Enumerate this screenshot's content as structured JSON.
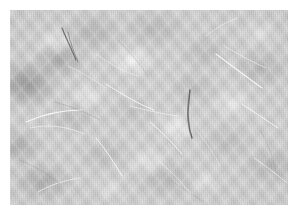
{
  "image": {
    "subject": "fibrous-nonwoven-material-micrograph",
    "alt_text": "Grayscale close-up micrograph of a fibrous nonwoven mat showing mottled light and dark clumps crossed by fine bright filaments",
    "orientation": "landscape",
    "canvas": {
      "width": 298,
      "height": 215
    },
    "plate": {
      "x": 10,
      "y": 10,
      "width": 278,
      "height": 195
    },
    "margin_px": 10
  },
  "palette": {
    "page_background": "#ffffff",
    "plate_base": "#cccccc",
    "lightest_tone": "#e4e4e4",
    "midtone": "#c4c4c4",
    "darkest_tone": "#8f8f8f",
    "bright_fiber": "#f6f6f6",
    "dark_fiber": "#4a4a4a",
    "grey_fiber": "#8d8d8d"
  },
  "texture": {
    "base_tone": "#cccccc",
    "weave_angle_primary_deg": 52,
    "weave_angle_secondary_deg": -46,
    "scanline_axis": "vertical",
    "grain": "fine"
  },
  "blotches": [
    {
      "cx": "6%",
      "cy": "38%",
      "rx": 46,
      "ry": 34,
      "tone": "#828282",
      "alpha": 0.85
    },
    {
      "cx": "18%",
      "cy": "26%",
      "rx": 38,
      "ry": 26,
      "tone": "#8c8c8c",
      "alpha": 0.7
    },
    {
      "cx": "3%",
      "cy": "70%",
      "rx": 34,
      "ry": 24,
      "tone": "#919191",
      "alpha": 0.62
    },
    {
      "cx": "30%",
      "cy": "12%",
      "rx": 40,
      "ry": 28,
      "tone": "#969696",
      "alpha": 0.55
    },
    {
      "cx": "52%",
      "cy": "10%",
      "rx": 44,
      "ry": 26,
      "tone": "#989898",
      "alpha": 0.48
    },
    {
      "cx": "70%",
      "cy": "22%",
      "rx": 36,
      "ry": 26,
      "tone": "#969696",
      "alpha": 0.42
    },
    {
      "cx": "90%",
      "cy": "30%",
      "rx": 42,
      "ry": 28,
      "tone": "#949494",
      "alpha": 0.5
    },
    {
      "cx": "12%",
      "cy": "88%",
      "rx": 40,
      "ry": 26,
      "tone": "#8e8e8e",
      "alpha": 0.6
    },
    {
      "cx": "56%",
      "cy": "86%",
      "rx": 44,
      "ry": 28,
      "tone": "#949494",
      "alpha": 0.46
    },
    {
      "cx": "94%",
      "cy": "80%",
      "rx": 42,
      "ry": 26,
      "tone": "#929292",
      "alpha": 0.46
    }
  ],
  "highlights": [
    {
      "cx": "44%",
      "cy": "26%",
      "rx": 30,
      "ry": 22,
      "alpha": 0.8
    },
    {
      "cx": "60%",
      "cy": "60%",
      "rx": 26,
      "ry": 20,
      "alpha": 0.72
    },
    {
      "cx": "28%",
      "cy": "44%",
      "rx": 24,
      "ry": 18,
      "alpha": 0.58
    },
    {
      "cx": "80%",
      "cy": "48%",
      "rx": 28,
      "ry": 20,
      "alpha": 0.56
    },
    {
      "cx": "50%",
      "cy": "78%",
      "rx": 30,
      "ry": 20,
      "alpha": 0.52
    }
  ],
  "fibers": {
    "dark": [
      {
        "id": "dark-fiber-center",
        "d": "M 180 80 C 178 96, 176 110, 182 128",
        "width": 1.6,
        "note": "prominent dark curved filament near centre"
      },
      {
        "id": "dark-fiber-upper-left",
        "d": "M 52 18 C 56 28, 62 40, 66 50",
        "width": 1.3
      },
      {
        "id": "dark-fiber-upper-left-b",
        "d": "M 58 22 C 60 32, 64 42, 68 52",
        "width": 0.9
      }
    ],
    "bright": [
      {
        "id": "bright-fiber-1",
        "d": "M 16 112 C 34 104, 52 100, 72 100",
        "width": 1.1
      },
      {
        "id": "bright-fiber-2",
        "d": "M 20 118 C 38 114, 56 116, 74 124",
        "width": 0.9
      },
      {
        "id": "bright-fiber-3",
        "d": "M 86 128 C 96 140, 104 152, 112 166",
        "width": 1.0
      },
      {
        "id": "bright-fiber-4",
        "d": "M 96 74 C 112 84, 128 94, 144 100",
        "width": 1.0
      },
      {
        "id": "bright-fiber-5",
        "d": "M 120 96 C 136 100, 152 104, 168 106",
        "width": 0.9
      },
      {
        "id": "bright-fiber-6",
        "d": "M 140 112 C 152 122, 162 132, 172 144",
        "width": 1.0
      },
      {
        "id": "bright-fiber-7",
        "d": "M 206 44 C 222 56, 238 68, 252 78",
        "width": 1.1
      },
      {
        "id": "bright-fiber-8",
        "d": "M 214 36 C 228 44, 242 52, 256 58",
        "width": 0.8
      },
      {
        "id": "bright-fiber-9",
        "d": "M 232 94 C 244 102, 256 110, 268 118",
        "width": 1.0
      },
      {
        "id": "bright-fiber-10",
        "d": "M 244 148 C 256 156, 266 164, 276 172",
        "width": 0.9
      },
      {
        "id": "bright-fiber-11",
        "d": "M 196 26 C 206 18, 216 12, 228 8",
        "width": 0.8
      },
      {
        "id": "bright-fiber-12",
        "d": "M 28 182 C 42 174, 56 170, 70 168",
        "width": 0.9
      },
      {
        "id": "bright-fiber-13",
        "d": "M 150 152 C 162 162, 172 172, 180 184",
        "width": 0.8
      },
      {
        "id": "bright-fiber-14",
        "d": "M 86 44 C 100 54, 114 62, 128 66",
        "width": 0.8
      },
      {
        "id": "bright-fiber-15",
        "d": "M 58 56 C 72 62, 84 70, 96 78",
        "width": 0.7
      },
      {
        "id": "bright-fiber-16",
        "d": "M 186 120 C 196 132, 204 144, 210 156",
        "width": 0.7
      }
    ],
    "grey": [
      {
        "id": "grey-fiber-1",
        "d": "M 44 92 C 60 96, 76 102, 90 110",
        "width": 0.8
      },
      {
        "id": "grey-fiber-2",
        "d": "M 108 30 C 120 42, 130 54, 138 66",
        "width": 0.8
      },
      {
        "id": "grey-fiber-3",
        "d": "M 250 120 C 258 134, 264 148, 266 162",
        "width": 0.7
      },
      {
        "id": "grey-fiber-4",
        "d": "M 10 150 C 24 156, 38 164, 50 174",
        "width": 0.8
      },
      {
        "id": "grey-fiber-5",
        "d": "M 160 170 C 172 178, 184 186, 194 192",
        "width": 0.7
      }
    ]
  }
}
